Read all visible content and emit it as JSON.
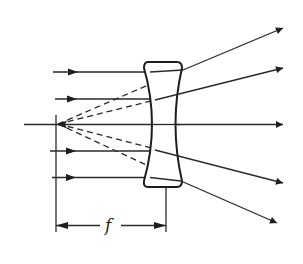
{
  "diagram": {
    "colors": {
      "stroke": "#1e1e1e",
      "background": "#ffffff"
    },
    "labels": {
      "focal_length": "f"
    },
    "elements": {
      "lens": "biconcave lens",
      "optical_axis": "optical axis",
      "focal_point": "virtual focal point (left)",
      "incoming_rays": 4,
      "outgoing_rays": 4,
      "dashed_construction_lines": 4,
      "dimension": "focal length f from focal point to lens"
    }
  }
}
